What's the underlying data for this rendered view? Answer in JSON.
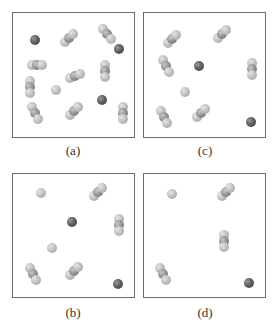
{
  "figure": {
    "panels": [
      {
        "id": "a",
        "label": "(a)",
        "triatomic_molecules": 10,
        "single_dark_atoms": 3,
        "single_light_atoms": 1
      },
      {
        "id": "c",
        "label": "(c)",
        "triatomic_molecules": 6,
        "single_dark_atoms": 2,
        "single_light_atoms": 1
      },
      {
        "id": "b",
        "label": "(b)",
        "triatomic_molecules": 4,
        "single_dark_atoms": 2,
        "single_light_atoms": 2
      },
      {
        "id": "d",
        "label": "(d)",
        "triatomic_molecules": 3,
        "single_dark_atoms": 1,
        "single_light_atoms": 1
      }
    ],
    "colors": {
      "frame": "#6a6a6a",
      "dark_atom": "#4e4e4e",
      "light_atom": "#bdbdbd",
      "label_text": "#333333"
    }
  }
}
